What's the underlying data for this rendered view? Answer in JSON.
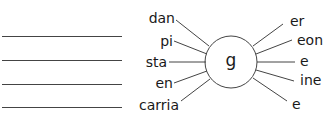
{
  "diagram": {
    "center": {
      "letter": "g"
    },
    "prefixes": [
      {
        "text": "dan"
      },
      {
        "text": "pi"
      },
      {
        "text": "sta"
      },
      {
        "text": "en"
      },
      {
        "text": "carria"
      }
    ],
    "suffixes": [
      {
        "text": "er"
      },
      {
        "text": "eon"
      },
      {
        "text": "e"
      },
      {
        "text": "ine"
      },
      {
        "text": "e"
      }
    ],
    "answer_lines_count": 4
  },
  "colors": {
    "ink": "#1a1a1a",
    "line": "#444444",
    "background": "#ffffff"
  }
}
